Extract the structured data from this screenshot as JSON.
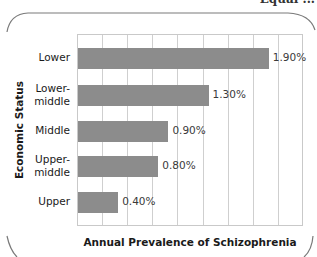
{
  "page": {
    "top_fragment": "Equal ..."
  },
  "chart_data": {
    "type": "bar",
    "orientation": "horizontal",
    "title": "",
    "xlabel": "Annual Prevalence of Schizophrenia",
    "ylabel": "Economic Status",
    "categories": [
      "Lower",
      "Lower-middle",
      "Middle",
      "Upper-middle",
      "Upper"
    ],
    "category_display": [
      [
        "Lower"
      ],
      [
        "Lower-",
        "middle"
      ],
      [
        "Middle"
      ],
      [
        "Upper-",
        "middle"
      ],
      [
        "Upper"
      ]
    ],
    "values": [
      1.9,
      1.3,
      0.9,
      0.8,
      0.4
    ],
    "value_labels": [
      "1.90%",
      "1.30%",
      "0.90%",
      "0.80%",
      "0.40%"
    ],
    "unit": "%",
    "xlim": [
      0,
      2.25
    ],
    "grid_step": 0.25,
    "grid": true,
    "tick_labels_shown": false,
    "legend": null,
    "bar_color": "#8c8c8c",
    "grid_color": "#cfcfcf"
  }
}
